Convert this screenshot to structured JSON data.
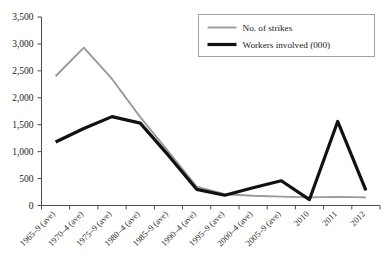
{
  "chart_data": {
    "type": "line",
    "title": "",
    "xlabel": "",
    "ylabel": "",
    "ylim": [
      0,
      3500
    ],
    "ytick_values": [
      0,
      500,
      1000,
      1500,
      2000,
      2500,
      3000,
      3500
    ],
    "ytick_labels": [
      "0",
      "500",
      "1,000",
      "1,500",
      "2,000",
      "2,500",
      "3,000",
      "3,500"
    ],
    "grid": false,
    "legend_position": "top-right",
    "categories": [
      "1965–9 (ave)",
      "1970–4 (ave)",
      "1975–9 (ave)",
      "1980–4 (ave)",
      "1985–9 (ave)",
      "1990–4 (ave)",
      "1995–9 (ave)",
      "2000–4 (ave)",
      "2005–9 (ave)",
      "2010",
      "2011",
      "2012"
    ],
    "series": [
      {
        "name": "No. of strikes",
        "color": "#9a9a9a",
        "stroke_width": 1.9,
        "values": [
          2400,
          2930,
          2350,
          1640,
          1000,
          350,
          210,
          180,
          165,
          150,
          160,
          150
        ]
      },
      {
        "name": "Workers involved (000)",
        "color": "#111111",
        "stroke_width": 3.2,
        "values": [
          1180,
          1430,
          1650,
          1530,
          930,
          300,
          190,
          330,
          460,
          110,
          1560,
          280
        ]
      }
    ]
  },
  "legend": {
    "entries": [
      {
        "label": "No. of strikes",
        "color": "#9a9a9a"
      },
      {
        "label": "Workers involved (000)",
        "color": "#111111"
      }
    ]
  }
}
